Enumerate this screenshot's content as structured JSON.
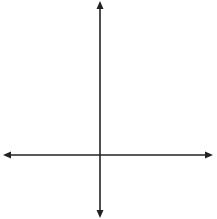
{
  "axes": {
    "x_label": "x",
    "y_label": "y",
    "origin_px": [
      100,
      155
    ],
    "unit_px": 17.8,
    "grid_x_range": [
      -5,
      6
    ],
    "grid_y_range": [
      -3,
      8
    ]
  },
  "points": [
    {
      "name": "N",
      "x": -1,
      "y": 5
    },
    {
      "name": "P",
      "x": 1,
      "y": 5
    },
    {
      "name": "O",
      "x": 0,
      "y": 3
    },
    {
      "name": "M",
      "x": -3,
      "y": 1
    },
    {
      "name": "Q",
      "x": 3,
      "y": -2
    }
  ],
  "colors": {
    "grid": "#c8c8c8",
    "axis": "#222222",
    "point": "#222222"
  },
  "caption_fragment": "( 1        )"
}
